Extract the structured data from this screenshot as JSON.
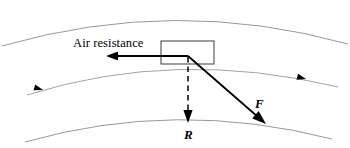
{
  "figure": {
    "type": "physics-free-body-diagram",
    "background_color": "#ffffff",
    "width": 350,
    "height": 148,
    "labels": {
      "air_resistance": "Air resistance",
      "force_f": "F",
      "reaction_r": "R"
    },
    "colors": {
      "arc_stroke": "#8c8c8c",
      "vector_stroke": "#000000",
      "body_stroke": "#4d4d4d",
      "label_text": "#000000"
    },
    "body": {
      "name": "vehicle-box",
      "x": 161,
      "y": 41,
      "width": 53,
      "height": 23,
      "stroke_width": 1.1
    },
    "origin_point": {
      "x": 188,
      "y": 56
    },
    "vectors": [
      {
        "name": "air-resistance-vector",
        "label": "Air resistance",
        "from": {
          "x": 188,
          "y": 56
        },
        "to": {
          "x": 107,
          "y": 56
        },
        "style": "solid",
        "direction": "left"
      },
      {
        "name": "force-f-vector",
        "label": "F",
        "from": {
          "x": 188,
          "y": 56
        },
        "to": {
          "x": 265,
          "y": 123
        },
        "style": "solid",
        "direction": "down-right"
      },
      {
        "name": "reaction-r-vector",
        "label": "R",
        "from": {
          "x": 188,
          "y": 60
        },
        "to": {
          "x": 188,
          "y": 122
        },
        "style": "dashed",
        "direction": "down"
      }
    ],
    "arcs": [
      {
        "name": "outer-upper-arc",
        "style": "solid",
        "stroke_width": 0.9,
        "path": "M 2 46 Q 175 -4 348 44"
      },
      {
        "name": "trajectory-arc",
        "style": "solid",
        "stroke_width": 0.8,
        "path": "M 27 95 Q 176 48 338 87",
        "has_direction_markers": true
      },
      {
        "name": "outer-lower-arc",
        "style": "solid",
        "stroke_width": 0.9,
        "path": "M 25 142 Q 176 99 332 139"
      }
    ],
    "direction_markers": [
      {
        "name": "trajectory-marker-left",
        "x": 43,
        "y": 90,
        "angle": 197
      },
      {
        "name": "trajectory-marker-right",
        "x": 305,
        "y": 79,
        "angle": 15
      }
    ]
  }
}
